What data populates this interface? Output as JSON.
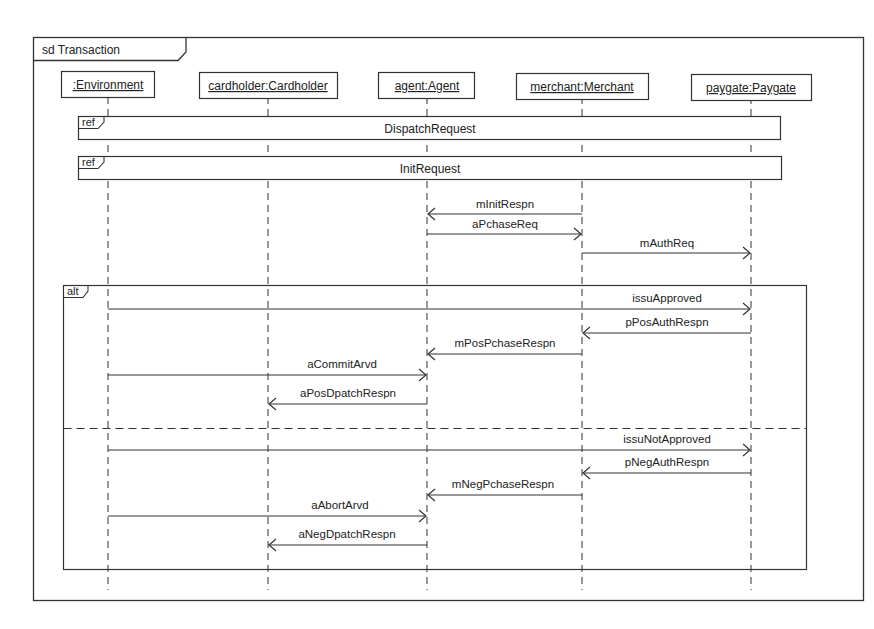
{
  "diagram": {
    "type": "UML sequence diagram",
    "frame_title": "sd Transaction",
    "lifelines": [
      {
        "id": "env",
        "label": ":Environment",
        "x": 108
      },
      {
        "id": "card",
        "label": "cardholder:Cardholder",
        "x": 268
      },
      {
        "id": "agent",
        "label": "agent:Agent",
        "x": 427
      },
      {
        "id": "merch",
        "label": "merchant:Merchant",
        "x": 582
      },
      {
        "id": "pay",
        "label": "paygate:Paygate",
        "x": 751
      }
    ],
    "refs": [
      {
        "tag": "ref",
        "label": "DispatchRequest"
      },
      {
        "tag": "ref",
        "label": "InitRequest"
      }
    ],
    "messages_pre": [
      {
        "label": "mInitRespn",
        "from": "merch",
        "to": "agent"
      },
      {
        "label": "aPchaseReq",
        "from": "agent",
        "to": "merch"
      },
      {
        "label": "mAuthReq",
        "from": "merch",
        "to": "pay"
      }
    ],
    "alt": {
      "tag": "alt",
      "operands": [
        {
          "messages": [
            {
              "label": "issuApproved",
              "from": "env",
              "to": "pay"
            },
            {
              "label": "pPosAuthRespn",
              "from": "pay",
              "to": "merch"
            },
            {
              "label": "mPosPchaseRespn",
              "from": "merch",
              "to": "agent"
            },
            {
              "label": "aCommitArvd",
              "from": "env",
              "to": "agent"
            },
            {
              "label": "aPosDpatchRespn",
              "from": "agent",
              "to": "card"
            }
          ]
        },
        {
          "messages": [
            {
              "label": "issuNotApproved",
              "from": "env",
              "to": "pay"
            },
            {
              "label": "pNegAuthRespn",
              "from": "pay",
              "to": "merch"
            },
            {
              "label": "mNegPchaseRespn",
              "from": "merch",
              "to": "agent"
            },
            {
              "label": "aAbortArvd",
              "from": "env",
              "to": "agent"
            },
            {
              "label": "aNegDpatchRespn",
              "from": "agent",
              "to": "card"
            }
          ]
        }
      ]
    }
  }
}
